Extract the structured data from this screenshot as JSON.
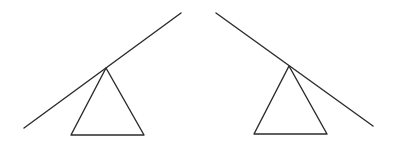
{
  "diagram": {
    "stroke_color": "#2b2b2b",
    "background_color": "#ffffff",
    "figures": [
      {
        "name": "left-seesaw",
        "tilt": "raised-right",
        "parts": [
          "plank",
          "fulcrum-triangle"
        ]
      },
      {
        "name": "right-seesaw",
        "tilt": "raised-left",
        "parts": [
          "plank",
          "fulcrum-triangle"
        ]
      }
    ]
  }
}
